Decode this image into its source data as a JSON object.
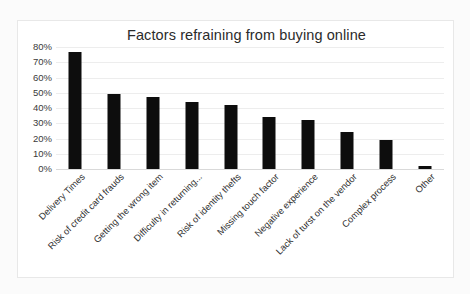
{
  "chart_data": {
    "type": "bar",
    "title": "Factors refraining from buying online",
    "xlabel": "",
    "ylabel": "",
    "ylim": [
      0,
      80
    ],
    "ytick_step": 10,
    "ytick_labels": [
      "0%",
      "10%",
      "20%",
      "30%",
      "40%",
      "50%",
      "60%",
      "70%",
      "80%"
    ],
    "ytick_values": [
      0,
      10,
      20,
      30,
      40,
      50,
      60,
      70,
      80
    ],
    "grid": true,
    "legend": false,
    "bar_color": "#0d0d0d",
    "categories": [
      "Delivery Times",
      "Risk of credit card frauds",
      "Getting the wrong item",
      "Difficulty in returning...",
      "Risk of identity thefts",
      "Missing touch factor",
      "Negative experience",
      "Lack of turst on the vendor",
      "Complex process",
      "Other"
    ],
    "values": [
      77,
      49,
      47,
      44,
      42,
      34,
      32,
      24,
      19,
      2
    ]
  }
}
